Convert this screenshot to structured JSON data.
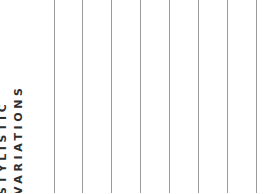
{
  "title": {
    "line1": "STYLISTIC",
    "line2": "VARIATIONS"
  },
  "grid": {
    "line_color": "#9a9a9a",
    "line_positions_px": [
      54,
      82,
      111,
      140,
      169,
      198,
      227,
      256
    ]
  },
  "colors": {
    "text": "#2e2e2e",
    "background": "#ffffff"
  }
}
